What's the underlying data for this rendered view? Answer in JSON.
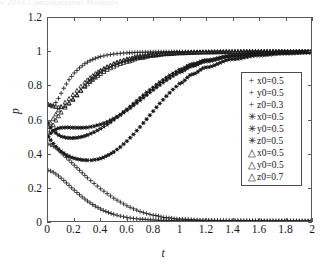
{
  "top_fragment": "v 2014   Computational   Methods",
  "axes": {
    "xlabel": "t",
    "ylabel": "p",
    "xticks": [
      "0",
      "0.2",
      "0.4",
      "0.6",
      "0.8",
      "1",
      "1.2",
      "1.4",
      "1.6",
      "1.8",
      "2"
    ],
    "yticks": [
      "0",
      "0.2",
      "0.4",
      "0.6",
      "0.8",
      "1",
      "1.2"
    ]
  },
  "legend": {
    "entries": [
      {
        "marker": "+",
        "marker_name": "plus-marker",
        "label": "x0=0.5"
      },
      {
        "marker": "+",
        "marker_name": "plus-marker",
        "label": "y0=0.5"
      },
      {
        "marker": "+",
        "marker_name": "plus-marker",
        "label": "z0=0.3"
      },
      {
        "marker": "✳",
        "marker_name": "asterisk-marker",
        "label": "x0=0.5"
      },
      {
        "marker": "✳",
        "marker_name": "asterisk-marker",
        "label": "y0=0.5"
      },
      {
        "marker": "✳",
        "marker_name": "asterisk-marker",
        "label": "z0=0.5"
      },
      {
        "marker": "△",
        "marker_name": "triangle-marker",
        "label": "x0=0.5"
      },
      {
        "marker": "△",
        "marker_name": "triangle-marker",
        "label": "y0=0.5"
      },
      {
        "marker": "△",
        "marker_name": "triangle-marker",
        "label": "z0=0.7"
      }
    ]
  },
  "chart_data": {
    "type": "scatter",
    "title": "",
    "xlabel": "t",
    "ylabel": "p",
    "xlim": [
      0,
      2
    ],
    "ylim": [
      0,
      1.2
    ],
    "xticks": [
      0,
      0.2,
      0.4,
      0.6,
      0.8,
      1,
      1.2,
      1.4,
      1.6,
      1.8,
      2
    ],
    "yticks": [
      0,
      0.2,
      0.4,
      0.6,
      0.8,
      1,
      1.2
    ],
    "grid": false,
    "legend_position": "right",
    "marker_color": "#1a1a1a",
    "series": [
      {
        "name": "x0=0.5",
        "group": "z0=0.3",
        "marker": "+",
        "x": [
          0,
          0.02,
          0.04,
          0.06,
          0.08,
          0.1,
          0.12,
          0.14,
          0.16,
          0.2,
          0.24,
          0.28,
          0.32,
          0.36,
          0.4,
          0.45,
          0.5,
          0.55,
          0.6,
          0.7,
          0.8,
          0.9,
          1.0,
          1.2,
          1.4,
          1.6,
          1.8,
          2.0
        ],
        "y": [
          0.69,
          0.68,
          0.685,
          0.7,
          0.725,
          0.755,
          0.785,
          0.81,
          0.835,
          0.875,
          0.905,
          0.93,
          0.948,
          0.962,
          0.972,
          0.981,
          0.987,
          0.991,
          0.994,
          0.997,
          0.999,
          1.0,
          1.0,
          1.0,
          1.0,
          1.0,
          1.0,
          1.0
        ]
      },
      {
        "name": "y0=0.5",
        "group": "z0=0.3",
        "marker": "+",
        "x": [
          0,
          0.02,
          0.04,
          0.06,
          0.08,
          0.1,
          0.14,
          0.18,
          0.22,
          0.26,
          0.3,
          0.35,
          0.4,
          0.45,
          0.5,
          0.55,
          0.6,
          0.65,
          0.7,
          0.75,
          0.8,
          0.9,
          1.0,
          1.2,
          1.4,
          1.6,
          1.8,
          2.0
        ],
        "y": [
          0.455,
          0.45,
          0.442,
          0.432,
          0.42,
          0.405,
          0.375,
          0.345,
          0.315,
          0.285,
          0.255,
          0.222,
          0.19,
          0.162,
          0.135,
          0.112,
          0.09,
          0.072,
          0.056,
          0.044,
          0.034,
          0.019,
          0.011,
          0.004,
          0.002,
          0.001,
          0.001,
          0.0
        ]
      },
      {
        "name": "z0=0.3",
        "group": "z0=0.3",
        "marker": "+",
        "x": [
          0,
          0.02,
          0.04,
          0.06,
          0.08,
          0.1,
          0.14,
          0.18,
          0.22,
          0.26,
          0.3,
          0.34,
          0.38,
          0.42,
          0.46,
          0.5,
          0.55,
          0.6,
          0.65,
          0.7,
          0.8,
          0.9,
          1.0,
          1.2,
          1.4,
          1.6,
          1.8,
          2.0
        ],
        "y": [
          0.3,
          0.295,
          0.288,
          0.278,
          0.266,
          0.253,
          0.225,
          0.196,
          0.168,
          0.142,
          0.118,
          0.097,
          0.079,
          0.063,
          0.05,
          0.039,
          0.029,
          0.021,
          0.015,
          0.011,
          0.006,
          0.003,
          0.002,
          0.001,
          0.0,
          0.0,
          0.0,
          0.0
        ]
      },
      {
        "name": "x0=0.5",
        "group": "z0=0.5",
        "marker": "✳",
        "x": [
          0,
          0.02,
          0.04,
          0.06,
          0.08,
          0.1,
          0.14,
          0.18,
          0.22,
          0.26,
          0.3,
          0.35,
          0.4,
          0.45,
          0.5,
          0.55,
          0.6,
          0.65,
          0.7,
          0.75,
          0.8,
          0.85,
          0.9,
          0.95,
          1.0,
          1.1,
          1.2,
          1.4,
          1.6,
          1.8,
          2.0
        ],
        "y": [
          0.58,
          0.555,
          0.535,
          0.52,
          0.508,
          0.5,
          0.492,
          0.49,
          0.492,
          0.498,
          0.508,
          0.525,
          0.546,
          0.57,
          0.598,
          0.628,
          0.66,
          0.693,
          0.727,
          0.76,
          0.79,
          0.82,
          0.848,
          0.872,
          0.894,
          0.928,
          0.951,
          0.978,
          0.99,
          0.996,
          0.999
        ]
      },
      {
        "name": "y0=0.5",
        "group": "z0=0.5",
        "marker": "✳",
        "x": [
          0,
          0.02,
          0.04,
          0.06,
          0.08,
          0.1,
          0.14,
          0.18,
          0.22,
          0.26,
          0.3,
          0.33,
          0.38,
          0.42,
          0.46,
          0.5,
          0.55,
          0.6,
          0.65,
          0.7,
          0.75,
          0.8,
          0.85,
          0.9,
          0.95,
          1.0,
          1.1,
          1.2,
          1.4,
          1.6,
          1.8,
          2.0
        ],
        "y": [
          0.5,
          0.478,
          0.458,
          0.44,
          0.424,
          0.41,
          0.39,
          0.375,
          0.366,
          0.361,
          0.359,
          0.359,
          0.365,
          0.375,
          0.39,
          0.408,
          0.437,
          0.472,
          0.512,
          0.556,
          0.602,
          0.649,
          0.695,
          0.738,
          0.777,
          0.812,
          0.868,
          0.908,
          0.956,
          0.979,
          0.99,
          0.996
        ]
      },
      {
        "name": "z0=0.5",
        "group": "z0=0.5",
        "marker": "✳",
        "x": [
          0,
          0.02,
          0.04,
          0.06,
          0.08,
          0.1,
          0.14,
          0.18,
          0.22,
          0.26,
          0.3,
          0.35,
          0.4,
          0.45,
          0.5,
          0.55,
          0.6,
          0.65,
          0.7,
          0.75,
          0.8,
          0.85,
          0.9,
          0.95,
          1.0,
          1.1,
          1.2,
          1.4,
          1.6,
          1.8,
          2.0
        ],
        "y": [
          0.5,
          0.518,
          0.532,
          0.542,
          0.548,
          0.551,
          0.553,
          0.552,
          0.551,
          0.551,
          0.553,
          0.56,
          0.571,
          0.586,
          0.605,
          0.628,
          0.654,
          0.683,
          0.713,
          0.744,
          0.775,
          0.804,
          0.832,
          0.857,
          0.879,
          0.916,
          0.943,
          0.974,
          0.988,
          0.995,
          0.998
        ]
      },
      {
        "name": "x0=0.5",
        "group": "z0=0.7",
        "marker": "△",
        "x": [
          0,
          0.02,
          0.04,
          0.06,
          0.08,
          0.1,
          0.13,
          0.16,
          0.19,
          0.22,
          0.25,
          0.28,
          0.31,
          0.35,
          0.4,
          0.45,
          0.5,
          0.55,
          0.6,
          0.7,
          0.8,
          0.9,
          1.0,
          1.2,
          1.4,
          1.6,
          1.8,
          2.0
        ],
        "y": [
          0.69,
          0.685,
          0.678,
          0.674,
          0.672,
          0.673,
          0.68,
          0.695,
          0.716,
          0.742,
          0.77,
          0.798,
          0.823,
          0.852,
          0.884,
          0.909,
          0.929,
          0.945,
          0.957,
          0.974,
          0.985,
          0.991,
          0.995,
          0.998,
          0.999,
          1.0,
          1.0,
          1.0
        ]
      },
      {
        "name": "y0=0.5",
        "group": "z0=0.7",
        "marker": "△",
        "x": [
          0,
          0.02,
          0.04,
          0.06,
          0.08,
          0.1,
          0.13,
          0.16,
          0.19,
          0.22,
          0.25,
          0.28,
          0.32,
          0.36,
          0.4,
          0.45,
          0.5,
          0.55,
          0.6,
          0.7,
          0.8,
          0.9,
          1.0,
          1.2,
          1.4,
          1.6,
          1.8,
          2.0
        ],
        "y": [
          0.555,
          0.578,
          0.604,
          0.63,
          0.654,
          0.675,
          0.7,
          0.722,
          0.745,
          0.77,
          0.795,
          0.818,
          0.846,
          0.87,
          0.89,
          0.911,
          0.928,
          0.942,
          0.953,
          0.97,
          0.982,
          0.989,
          0.993,
          0.998,
          0.999,
          1.0,
          1.0,
          1.0
        ]
      },
      {
        "name": "z0=0.7",
        "group": "z0=0.7",
        "marker": "△",
        "x": [
          0,
          0.02,
          0.04,
          0.06,
          0.08,
          0.1,
          0.13,
          0.16,
          0.19,
          0.22,
          0.25,
          0.28,
          0.32,
          0.36,
          0.4,
          0.45,
          0.5,
          0.55,
          0.6,
          0.7,
          0.8,
          0.9,
          1.0,
          1.2,
          1.4,
          1.6,
          1.8,
          2.0
        ],
        "y": [
          0.5,
          0.535,
          0.566,
          0.594,
          0.619,
          0.641,
          0.67,
          0.695,
          0.72,
          0.745,
          0.77,
          0.793,
          0.822,
          0.847,
          0.869,
          0.893,
          0.912,
          0.928,
          0.941,
          0.963,
          0.977,
          0.986,
          0.991,
          0.997,
          0.999,
          1.0,
          1.0,
          1.0
        ]
      }
    ]
  }
}
